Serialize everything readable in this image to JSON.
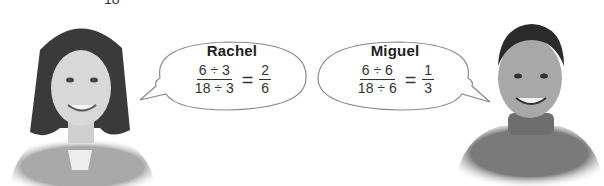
{
  "page_fragment": {
    "top_cut_text": "18"
  },
  "students": [
    {
      "name": "Rachel",
      "work": {
        "numerator": "6 ÷ 3",
        "denominator": "18 ÷ 3",
        "equals": "=",
        "result_num": "2",
        "result_den": "6"
      }
    },
    {
      "name": "Miguel",
      "work": {
        "numerator": "6 ÷ 6",
        "denominator": "18 ÷ 6",
        "equals": "=",
        "result_num": "1",
        "result_den": "3"
      }
    }
  ],
  "colors": {
    "bubble_fill": "#ffffff",
    "bubble_stroke": "#8a8a8a",
    "text": "#222222"
  }
}
